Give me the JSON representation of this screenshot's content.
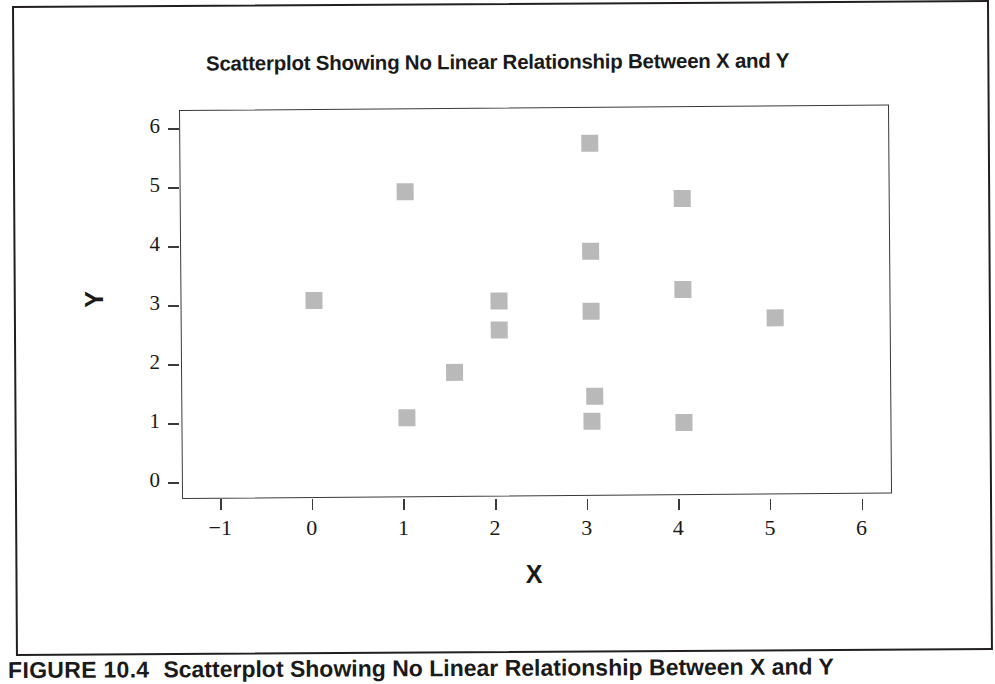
{
  "figure": {
    "caption_label": "FIGURE 10.4",
    "caption_text": "Scatterplot Showing No Linear Relationship Between X and Y"
  },
  "chart_data": {
    "type": "scatter",
    "title": "Scatterplot Showing No Linear Relationship Between X and Y",
    "xlabel": "X",
    "ylabel": "Y",
    "xlim": [
      -1.45,
      6.3
    ],
    "ylim": [
      -0.28,
      6.3
    ],
    "xticks": [
      -1,
      0,
      1,
      2,
      3,
      4,
      5,
      6
    ],
    "xticklabels": [
      "−1",
      "0",
      "1",
      "2",
      "3",
      "4",
      "5",
      "6"
    ],
    "yticks": [
      0,
      1,
      2,
      3,
      4,
      5,
      6
    ],
    "yticklabels": [
      "0",
      "1",
      "2",
      "3",
      "4",
      "5",
      "6"
    ],
    "grid": false,
    "legend": null,
    "marker": "square",
    "marker_color": "#b9b9b9",
    "marker_size": 17,
    "n_points": 15,
    "points": [
      {
        "x": 0.0,
        "y": 3.08
      },
      {
        "x": 1.0,
        "y": 4.91
      },
      {
        "x": 1.0,
        "y": 1.08
      },
      {
        "x": 1.52,
        "y": 1.84
      },
      {
        "x": 2.02,
        "y": 3.05
      },
      {
        "x": 2.02,
        "y": 2.55
      },
      {
        "x": 3.02,
        "y": 5.7
      },
      {
        "x": 3.02,
        "y": 3.88
      },
      {
        "x": 3.02,
        "y": 2.85
      },
      {
        "x": 3.05,
        "y": 1.42
      },
      {
        "x": 3.02,
        "y": 0.99
      },
      {
        "x": 4.02,
        "y": 4.76
      },
      {
        "x": 4.02,
        "y": 3.21
      },
      {
        "x": 4.02,
        "y": 0.96
      },
      {
        "x": 5.03,
        "y": 2.72
      }
    ]
  }
}
